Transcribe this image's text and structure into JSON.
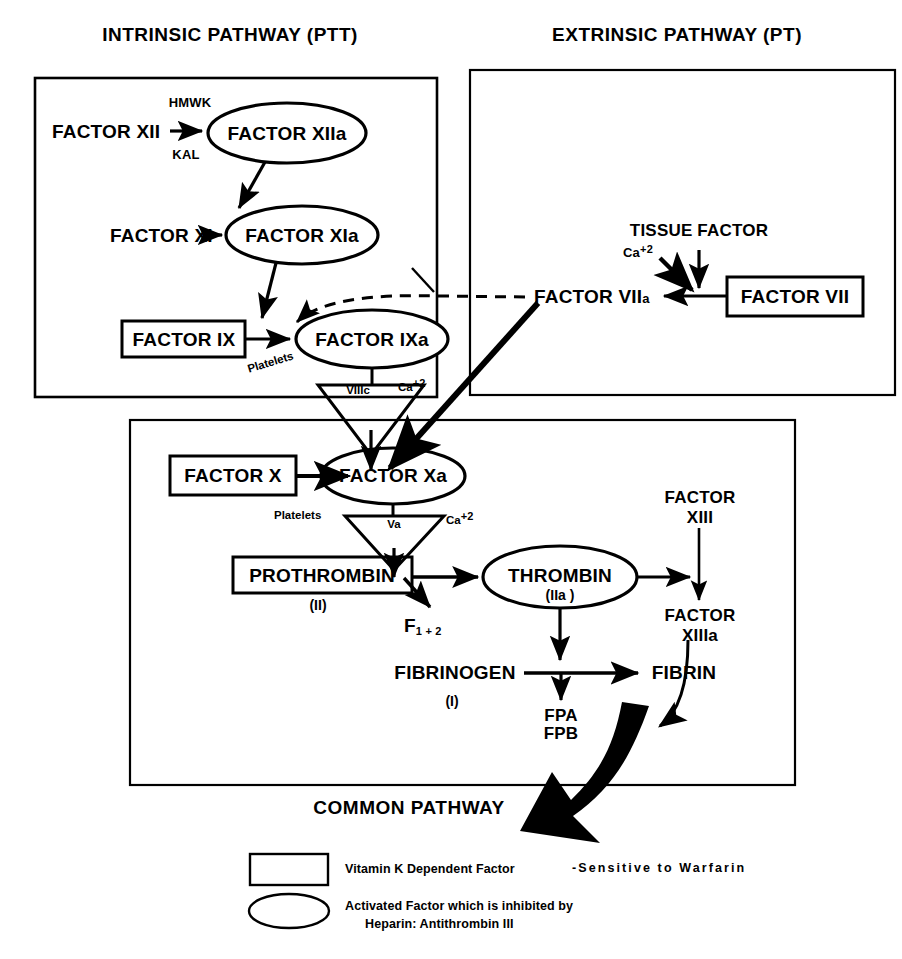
{
  "diagram": {
    "headers": {
      "intrinsic": "INTRINSIC PATHWAY (PTT)",
      "extrinsic": "EXTRINSIC PATHWAY (PT)",
      "common": "COMMON PATHWAY"
    },
    "intrinsic": {
      "factor_xii": "FACTOR XII",
      "hmwk": "HMWK",
      "kal": "KAL",
      "factor_xiia": "FACTOR XIIa",
      "factor_xi": "FACTOR XI",
      "factor_xia": "FACTOR XIa",
      "factor_ix": "FACTOR IX",
      "factor_ixa": "FACTOR IXa",
      "platelets": "Platelets",
      "viiic": "VIIIc",
      "ca_ix": "Ca",
      "ca_ix_sup": "+2"
    },
    "extrinsic": {
      "tissue_factor": "TISSUE FACTOR",
      "ca": "Ca",
      "ca_sup": "+2",
      "factor_viia": "FACTOR VII",
      "factor_viia_a": "a",
      "factor_vii": "FACTOR VII"
    },
    "common": {
      "factor_x": "FACTOR X",
      "factor_xa": "FACTOR Xa",
      "platelets_x": "Platelets",
      "va": "Va",
      "ca_x": "Ca",
      "ca_x_sup": "+2",
      "prothrombin": "PROTHROMBIN",
      "prothrombin_num": "(II)",
      "f12_label": "F",
      "f12_sub": "1 + 2",
      "thrombin": "THROMBIN",
      "thrombin_num": "(IIa )",
      "factor_xiii_l1": "FACTOR",
      "factor_xiii_l2": "XIII",
      "factor_xiiia_l1": "FACTOR",
      "factor_xiiia_l2": "XIIIa",
      "fibrinogen": "FIBRINOGEN",
      "fibrinogen_num": "(I)",
      "fpa": "FPA",
      "fpb": "FPB",
      "fibrin": "FIBRIN"
    },
    "legend": {
      "rect_text": "Vitamin K Dependent Factor",
      "rect_text2": "-Sensitive to Warfarin",
      "ellipse_line1": "Activated Factor which is inhibited by",
      "ellipse_line2": "Heparin: Antithrombin III"
    },
    "colors": {
      "ink": "#000000",
      "paper": "#ffffff"
    }
  }
}
